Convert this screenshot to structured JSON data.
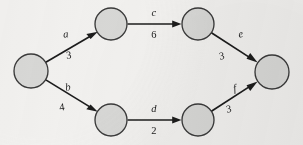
{
  "diagram": {
    "background_color": "#f2f1ef",
    "node_fill_color": "#d8d8d6",
    "node_stroke_color": "#3a3a3a",
    "edge_color": "#1c1c1c",
    "nodes": [
      {
        "id": "start",
        "label": "",
        "cx": 31,
        "cy": 71,
        "r": 17
      },
      {
        "id": "top-left",
        "label": "",
        "cx": 111,
        "cy": 24,
        "r": 16
      },
      {
        "id": "top-right",
        "label": "",
        "cx": 198,
        "cy": 24,
        "r": 16
      },
      {
        "id": "bottom-left",
        "label": "",
        "cx": 111,
        "cy": 120,
        "r": 16
      },
      {
        "id": "bottom-right",
        "label": "",
        "cx": 198,
        "cy": 120,
        "r": 16
      },
      {
        "id": "end",
        "label": "",
        "cx": 272,
        "cy": 72,
        "r": 17
      }
    ],
    "edges": [
      {
        "id": "edge-a",
        "from": "start",
        "to": "top-left",
        "label": "a",
        "weight": "3"
      },
      {
        "id": "edge-b",
        "from": "start",
        "to": "bottom-left",
        "label": "b",
        "weight": "4"
      },
      {
        "id": "edge-c",
        "from": "top-left",
        "to": "top-right",
        "label": "c",
        "weight": "6"
      },
      {
        "id": "edge-d",
        "from": "bottom-left",
        "to": "bottom-right",
        "label": "d",
        "weight": "2"
      },
      {
        "id": "edge-e",
        "from": "top-right",
        "to": "end",
        "label": "e",
        "weight": "3"
      },
      {
        "id": "edge-f",
        "from": "bottom-right",
        "to": "end",
        "label": "f",
        "weight": "3"
      }
    ],
    "labels": {
      "edge_a_name": "a",
      "edge_a_weight": "3",
      "edge_b_name": "b",
      "edge_b_weight": "4",
      "edge_c_name": "c",
      "edge_c_weight": "6",
      "edge_d_name": "d",
      "edge_d_weight": "2",
      "edge_e_name": "e",
      "edge_e_weight": "3",
      "edge_f_name": "f",
      "edge_f_weight": "3"
    }
  }
}
